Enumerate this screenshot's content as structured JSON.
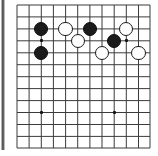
{
  "figure": {
    "kind": "go-board-diagram",
    "width": 158,
    "height": 156,
    "background_color": "#ffffff"
  },
  "board": {
    "line_color": "#3b3b3b",
    "line_width": 1,
    "grid_spacing": 12.15,
    "origin_x": 17,
    "origin_y": 5,
    "columns": 12,
    "rows": 13,
    "x_lines": [
      17,
      29.1,
      41.3,
      53.4,
      65.6,
      77.7,
      89.9,
      102,
      114.2,
      126.3,
      138.5,
      150
    ],
    "y_lines": [
      5,
      16.9,
      28.9,
      40.8,
      52.8,
      64.7,
      76.7,
      88.6,
      100.6,
      112.5,
      124.5,
      136.4,
      148
    ],
    "edge_shadow_color": "#3a3a3a"
  },
  "star_points": {
    "label": "hoshi",
    "color": "#131313",
    "size": 3.4,
    "points": [
      {
        "name": "hoshi-upper-left",
        "x": 41.3,
        "y": 40.8
      },
      {
        "name": "hoshi-lower-left",
        "x": 41.3,
        "y": 112.5
      },
      {
        "name": "hoshi-lower-right",
        "x": 114.2,
        "y": 112.5
      },
      {
        "name": "hoshi-upper-right",
        "x": 126.3,
        "y": 40.8
      }
    ]
  },
  "stones": {
    "radius": 7.2,
    "black_color": "#1b1b1b",
    "white_color": "#fdfdfd",
    "white_border_color": "#1b1b1b",
    "items": [
      {
        "name": "black-stone-1",
        "color": "black",
        "x": 41.3,
        "y": 28.9
      },
      {
        "name": "black-stone-2",
        "color": "black",
        "x": 41.3,
        "y": 52.8
      },
      {
        "name": "black-stone-3",
        "color": "black",
        "x": 89.9,
        "y": 28.9
      },
      {
        "name": "black-stone-4",
        "color": "black",
        "x": 114.2,
        "y": 40.8
      },
      {
        "name": "white-stone-1",
        "color": "white",
        "x": 65.6,
        "y": 28.9
      },
      {
        "name": "white-stone-2",
        "color": "white",
        "x": 77.7,
        "y": 40.8
      },
      {
        "name": "white-stone-3",
        "color": "white",
        "x": 102.0,
        "y": 52.8
      },
      {
        "name": "white-stone-4",
        "color": "white",
        "x": 126.3,
        "y": 28.9
      },
      {
        "name": "white-stone-5",
        "color": "white",
        "x": 138.5,
        "y": 52.8
      }
    ]
  }
}
